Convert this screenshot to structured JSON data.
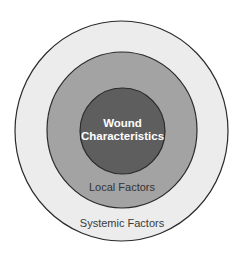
{
  "diagram": {
    "type": "concentric-circles",
    "background": "#ffffff",
    "stroke_color": "#2a2a2a",
    "layers": [
      {
        "id": "systemic",
        "label": "Systemic Factors",
        "fill": "#ececec",
        "text_color": "#3a3a3a"
      },
      {
        "id": "local",
        "label": "Local Factors",
        "fill": "#a3a3a3",
        "text_color": "#333333"
      },
      {
        "id": "core",
        "label_line1": "Wound",
        "label_line2": "Characteristics",
        "fill": "#5e5e5e",
        "text_color": "#ffffff"
      }
    ]
  }
}
